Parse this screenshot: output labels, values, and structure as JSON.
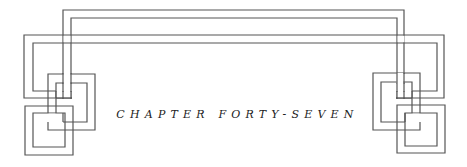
{
  "chapter": {
    "heading": "CHAPTER FORTY-SEVEN"
  },
  "ornament": {
    "style": "interlaced-knot-border",
    "line_color": "#555555",
    "background": "#ffffff"
  }
}
